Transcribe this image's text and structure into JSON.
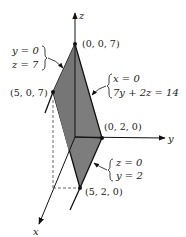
{
  "diagram": {
    "type": "3d-polyhedron-plane-section",
    "colors": {
      "background": "#ffffff",
      "shading": "#7d7d7d",
      "line": "#111111",
      "dashed": "#555555"
    },
    "axes": {
      "x": {
        "label": "x"
      },
      "y": {
        "label": "y"
      },
      "z": {
        "label": "z"
      }
    },
    "points": {
      "p007": "(0, 0, 7)",
      "p507": "(5, 0, 7)",
      "p020": "(0, 2, 0)",
      "p520": "(5, 2, 0)"
    },
    "annotations": {
      "top_edge": {
        "line1": "y = 0",
        "line2": "z = 7"
      },
      "slant_edge": {
        "line1": "x = 0",
        "line2": "7y + 2z = 14"
      },
      "bottom_edge": {
        "line1": "z = 0",
        "line2": "y = 2"
      }
    }
  }
}
